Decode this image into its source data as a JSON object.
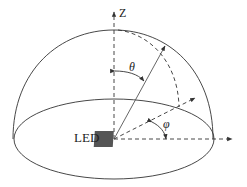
{
  "labels": {
    "z_axis": "Z",
    "theta": "θ",
    "phi": "φ",
    "source": "LED"
  },
  "colors": {
    "line": "#333333",
    "led_fill": "#555555"
  }
}
